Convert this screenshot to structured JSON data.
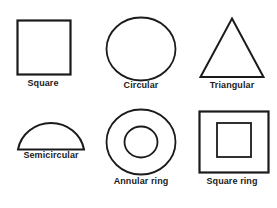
{
  "diagram": {
    "stroke_color": "#1b1b1b",
    "fill_color": "#ffffff",
    "background": "#ffffff",
    "figures": [
      {
        "id": "square",
        "label": "Square",
        "shape": "square",
        "icon": "square-icon",
        "row": 1,
        "column": 1
      },
      {
        "id": "circular",
        "label": "Circular",
        "shape": "circle",
        "icon": "circle-icon",
        "row": 1,
        "column": 2
      },
      {
        "id": "triangular",
        "label": "Triangular",
        "shape": "triangle",
        "icon": "triangle-icon",
        "row": 1,
        "column": 3
      },
      {
        "id": "semicircular",
        "label": "Semicircular",
        "shape": "semicircle",
        "icon": "semicircle-icon",
        "row": 2,
        "column": 1
      },
      {
        "id": "annular-ring",
        "label": "Annular ring",
        "shape": "concentric-circles",
        "icon": "annulus-icon",
        "row": 2,
        "column": 2
      },
      {
        "id": "square-ring",
        "label": "Square ring",
        "shape": "concentric-squares",
        "icon": "square-annulus-icon",
        "row": 2,
        "column": 3
      }
    ]
  }
}
